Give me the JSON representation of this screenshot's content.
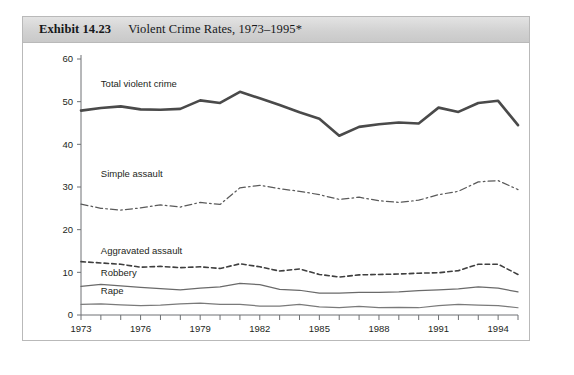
{
  "exhibit": {
    "number_label": "Exhibit 14.23",
    "title": "Violent Crime Rates, 1973–1995*"
  },
  "source_note": "",
  "colors": {
    "header_background": "#d4d4d4",
    "frame_border": "#b9b9b9",
    "axis": "#6e7174",
    "total_violent_crime": "#4a4a4a",
    "simple_assault": "#5a5a5a",
    "aggravated_assault": "#3f3f3f",
    "robbery": "#6a6a6a",
    "rape": "#7a7a7a",
    "text": "#1d1f21"
  },
  "chart_data": {
    "type": "line",
    "title": "Violent Crime Rates, 1973–1995*",
    "xlabel": "",
    "ylabel": "",
    "xlim": [
      1973,
      1995
    ],
    "ylim": [
      0,
      60
    ],
    "yticks": [
      0,
      10,
      20,
      30,
      40,
      50,
      60
    ],
    "xticks": [
      1973,
      1974,
      1975,
      1976,
      1977,
      1978,
      1979,
      1980,
      1981,
      1982,
      1983,
      1984,
      1985,
      1986,
      1987,
      1988,
      1989,
      1990,
      1991,
      1992,
      1993,
      1994,
      1995
    ],
    "xtick_labels_shown": [
      "1973",
      "1976",
      "1979",
      "1982",
      "1985",
      "1988",
      "1991",
      "1994"
    ],
    "grid": false,
    "legend_position": "inline-labels",
    "x": [
      1973,
      1974,
      1975,
      1976,
      1977,
      1978,
      1979,
      1980,
      1981,
      1982,
      1983,
      1984,
      1985,
      1986,
      1987,
      1988,
      1989,
      1990,
      1991,
      1992,
      1993,
      1994,
      1995
    ],
    "series": [
      {
        "name": "Total violent crime",
        "label": "Total violent crime",
        "style": "solid-thick",
        "values": [
          47.9,
          48.5,
          48.9,
          48.2,
          48.1,
          48.3,
          50.3,
          49.7,
          52.3,
          50.8,
          49.2,
          47.5,
          46.0,
          42.0,
          44.1,
          44.7,
          45.1,
          44.9,
          48.6,
          47.6,
          49.7,
          50.2,
          44.5
        ]
      },
      {
        "name": "Simple assault",
        "label": "Simple assault",
        "style": "dash-dot",
        "values": [
          26.0,
          25.0,
          24.6,
          25.1,
          25.8,
          25.3,
          26.4,
          25.9,
          29.8,
          30.4,
          29.6,
          29.0,
          28.2,
          27.1,
          27.6,
          26.8,
          26.4,
          26.9,
          28.2,
          29.0,
          31.2,
          31.5,
          29.4
        ]
      },
      {
        "name": "Aggravated assault",
        "label": "Aggravated assault",
        "style": "dashed",
        "values": [
          12.5,
          12.2,
          11.9,
          11.2,
          11.4,
          11.1,
          11.3,
          10.9,
          12.0,
          11.3,
          10.3,
          10.8,
          9.5,
          8.9,
          9.4,
          9.5,
          9.6,
          9.8,
          9.9,
          10.4,
          11.9,
          11.9,
          9.5
        ]
      },
      {
        "name": "Robbery",
        "label": "Robbery",
        "style": "solid-thin",
        "values": [
          6.7,
          7.2,
          6.8,
          6.5,
          6.2,
          5.9,
          6.3,
          6.6,
          7.4,
          7.1,
          6.0,
          5.8,
          5.1,
          5.1,
          5.3,
          5.3,
          5.4,
          5.7,
          5.9,
          6.1,
          6.6,
          6.3,
          5.4
        ]
      },
      {
        "name": "Rape",
        "label": "Rape",
        "style": "solid-thin",
        "values": [
          2.5,
          2.6,
          2.4,
          2.2,
          2.3,
          2.6,
          2.8,
          2.5,
          2.5,
          2.1,
          2.1,
          2.5,
          1.9,
          1.7,
          2.0,
          1.7,
          1.8,
          1.7,
          2.2,
          2.5,
          2.3,
          2.2,
          1.7
        ]
      }
    ],
    "series_label_positions": [
      {
        "name": "Total violent crime",
        "x": 1974.0,
        "y": 53.5
      },
      {
        "name": "Simple assault",
        "x": 1974.0,
        "y": 32.3
      },
      {
        "name": "Aggravated assault",
        "x": 1974.0,
        "y": 14.4
      },
      {
        "name": "Robbery",
        "x": 1974.0,
        "y": 9.1
      },
      {
        "name": "Rape",
        "x": 1974.0,
        "y": 5.0
      }
    ]
  }
}
